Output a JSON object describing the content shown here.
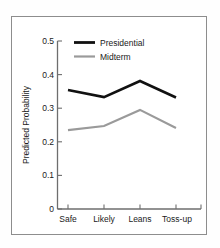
{
  "figure": {
    "frame_color": "#8d8d8d",
    "background": "#ffffff"
  },
  "chart_data": {
    "type": "line",
    "title": "",
    "xlabel": "",
    "ylabel": "Predicted Probability",
    "categories": [
      "Safe",
      "Likely",
      "Leans",
      "Toss-up"
    ],
    "ylim": [
      0,
      0.5
    ],
    "yticks": [
      0,
      0.1,
      0.2,
      0.3,
      0.4,
      0.5
    ],
    "ytick_labels": [
      "0",
      "0.1",
      "0.2",
      "0.3",
      "0.4",
      "0.5"
    ],
    "grid": false,
    "legend_position": "top-right-inside",
    "series": [
      {
        "name": "Presidential",
        "values": [
          0.354,
          0.333,
          0.381,
          0.332
        ],
        "color": "#111111",
        "width": 2.6
      },
      {
        "name": "Midterm",
        "values": [
          0.235,
          0.247,
          0.295,
          0.241
        ],
        "color": "#9a9a9a",
        "width": 2.2
      }
    ]
  },
  "axis": {
    "y_title": "Predicted Probability"
  },
  "legend": {
    "entries": [
      {
        "label": "Presidential",
        "color": "#111111"
      },
      {
        "label": "Midterm",
        "color": "#9a9a9a"
      }
    ]
  }
}
